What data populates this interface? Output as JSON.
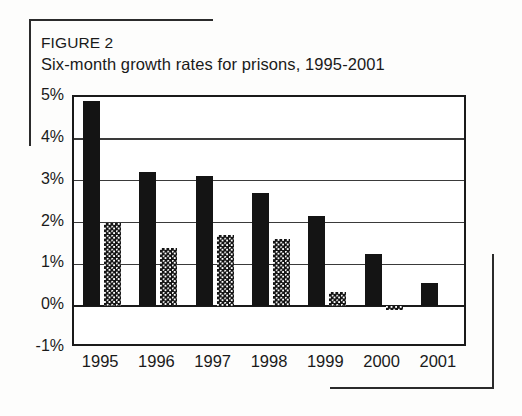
{
  "figure": {
    "label": "FIGURE 2",
    "caption": "Six-month growth rates for prisons, 1995-2001"
  },
  "chart_data": {
    "type": "bar",
    "title": "Six-month growth rates for prisons, 1995-2001",
    "subtitle": "FIGURE 2",
    "xlabel": "",
    "ylabel": "",
    "categories": [
      "1995",
      "1996",
      "1997",
      "1998",
      "1999",
      "2000",
      "2001"
    ],
    "series": [
      {
        "name": "first-half",
        "style": "solid",
        "values": [
          4.9,
          3.2,
          3.1,
          2.7,
          2.15,
          1.25,
          0.55
        ]
      },
      {
        "name": "second-half",
        "style": "dotted",
        "values": [
          2.0,
          1.4,
          1.7,
          1.6,
          0.35,
          -0.1,
          null
        ]
      }
    ],
    "ylim": [
      -1,
      5
    ],
    "ytick_values": [
      5,
      4,
      3,
      2,
      1,
      0,
      -1
    ],
    "ytick_labels": [
      "5%",
      "4%",
      "3%",
      "2%",
      "1%",
      "0%",
      "-1%"
    ],
    "grid": true,
    "grid_axis": "y",
    "legend": "none",
    "bar_color": "#141414",
    "axis_color": "#1a1a1a",
    "background": "#ffffff"
  }
}
